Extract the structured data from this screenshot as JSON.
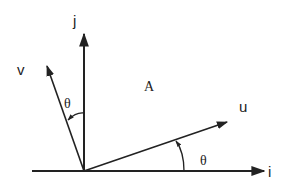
{
  "diagram": {
    "labels": {
      "j": "j",
      "i": "i",
      "u": "u",
      "v": "v",
      "A": "A",
      "theta_upper": "θ",
      "theta_lower": "θ"
    },
    "colors": {
      "stroke": "#222222",
      "background": "#ffffff"
    }
  }
}
